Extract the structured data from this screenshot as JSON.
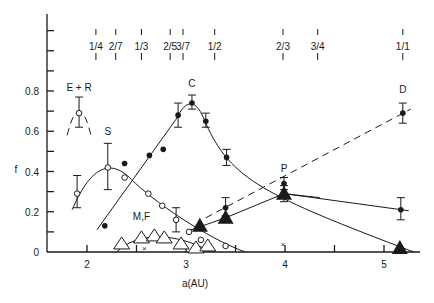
{
  "chart_data": {
    "type": "scatter",
    "title": "",
    "xlabel": "a(AU)",
    "ylabel": "f",
    "xlim": [
      1.6,
      5.4
    ],
    "ylim": [
      0,
      1.1
    ],
    "grid": false,
    "x_ticks": [
      2,
      3,
      4,
      5
    ],
    "x_minor_ticks": [
      2.5,
      3.5,
      4.5
    ],
    "y_ticks": [
      0,
      0.2,
      0.4,
      0.6,
      0.8
    ],
    "y_tick_labels": [
      "0",
      "0.2",
      "0.4",
      "0.6",
      "0.8"
    ],
    "y_minor_step": 0.1,
    "resonances": [
      {
        "label": "1/4",
        "a": 2.09
      },
      {
        "label": "2/7",
        "a": 2.29
      },
      {
        "label": "1/3",
        "a": 2.55
      },
      {
        "label": "2/5",
        "a": 2.84
      },
      {
        "label": "3/7",
        "a": 2.97
      },
      {
        "label": "1/2",
        "a": 3.29
      },
      {
        "label": "2/3",
        "a": 3.98
      },
      {
        "label": "3/4",
        "a": 4.33
      },
      {
        "label": "1/1",
        "a": 5.19
      }
    ],
    "series": [
      {
        "name": "E + R",
        "marker": "open-circle",
        "line": "dashed-arc",
        "points": [
          {
            "a": 1.92,
            "f": 0.69,
            "err": [
              0.62,
              0.77
            ]
          }
        ],
        "label_pos": {
          "a": 1.92,
          "f": 0.8
        }
      },
      {
        "name": "S",
        "marker": "open-circle",
        "line": "solid-curve",
        "points": [
          {
            "a": 1.9,
            "f": 0.29,
            "err": [
              0.22,
              0.38
            ]
          },
          {
            "a": 2.21,
            "f": 0.42,
            "err": [
              0.31,
              0.54
            ]
          },
          {
            "a": 2.38,
            "f": 0.37
          },
          {
            "a": 2.62,
            "f": 0.29
          },
          {
            "a": 2.76,
            "f": 0.23
          },
          {
            "a": 2.9,
            "f": 0.16,
            "err": [
              0.1,
              0.22
            ]
          },
          {
            "a": 3.03,
            "f": 0.1
          },
          {
            "a": 3.15,
            "f": 0.06
          },
          {
            "a": 3.4,
            "f": 0.03
          }
        ],
        "label_pos": {
          "a": 2.21,
          "f": 0.58
        }
      },
      {
        "name": "C",
        "marker": "filled-circle",
        "line": "solid-curve",
        "points": [
          {
            "a": 2.18,
            "f": 0.13
          },
          {
            "a": 2.38,
            "f": 0.44
          },
          {
            "a": 2.63,
            "f": 0.48
          },
          {
            "a": 2.77,
            "f": 0.51
          },
          {
            "a": 2.92,
            "f": 0.68,
            "err": [
              0.62,
              0.74
            ]
          },
          {
            "a": 3.06,
            "f": 0.74,
            "err": [
              0.71,
              0.78
            ]
          },
          {
            "a": 3.2,
            "f": 0.65,
            "err": [
              0.62,
              0.69
            ]
          },
          {
            "a": 3.41,
            "f": 0.47,
            "err": [
              0.43,
              0.51
            ]
          }
        ],
        "label_pos": {
          "a": 3.06,
          "f": 0.82
        }
      },
      {
        "name": "P",
        "marker": "filled-triangle",
        "line": "solid",
        "points": [
          {
            "a": 3.14,
            "f": 0.13
          },
          {
            "a": 3.4,
            "f": 0.17
          },
          {
            "a": 3.99,
            "f": 0.29,
            "err": [
              0.25,
              0.33
            ]
          },
          {
            "a": 5.16,
            "f": 0.02
          }
        ],
        "label_pos": {
          "a": 3.99,
          "f": 0.4
        }
      },
      {
        "name": "D",
        "marker": "filled-circle",
        "line": "dashed",
        "points": [
          {
            "a": 3.4,
            "f": 0.22,
            "err": [
              0.18,
              0.27
            ]
          },
          {
            "a": 3.99,
            "f": 0.34,
            "err": [
              0.31,
              0.37
            ]
          },
          {
            "a": 5.19,
            "f": 0.69,
            "err": [
              0.64,
              0.74
            ]
          }
        ],
        "label_pos": {
          "a": 5.19,
          "f": 0.79
        }
      },
      {
        "name": "P-high-a branch",
        "marker": "filled-circle",
        "line": "solid",
        "points": [
          {
            "a": 3.99,
            "f": 0.29
          },
          {
            "a": 5.17,
            "f": 0.21,
            "err": [
              0.16,
              0.27
            ]
          }
        ]
      },
      {
        "name": "M,F",
        "marker": "open-triangle",
        "line": "solid-curve",
        "points": [
          {
            "a": 2.35,
            "f": 0.04
          },
          {
            "a": 2.55,
            "f": 0.07
          },
          {
            "a": 2.68,
            "f": 0.08
          },
          {
            "a": 2.78,
            "f": 0.07
          },
          {
            "a": 2.95,
            "f": 0.04
          },
          {
            "a": 3.1,
            "f": 0.02
          },
          {
            "a": 3.22,
            "f": 0.03
          }
        ],
        "label_pos": {
          "a": 2.55,
          "f": 0.16
        }
      }
    ],
    "crosses": [
      {
        "a": 2.58,
        "f": 0.02
      },
      {
        "a": 3.98,
        "f": 0.04
      }
    ],
    "labels": [
      "E + R",
      "S",
      "C",
      "M,F",
      "P",
      "D"
    ]
  }
}
